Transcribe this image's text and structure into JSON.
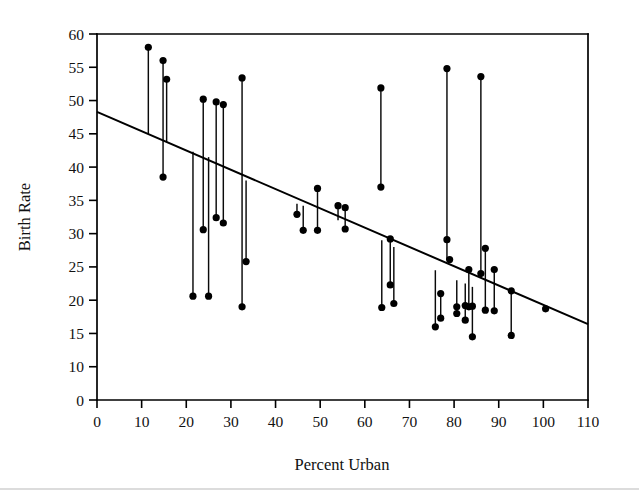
{
  "figure": {
    "title": "",
    "background_color": "#ffffff",
    "ink_color": "#000000",
    "width": 639,
    "height": 492
  },
  "axes": {
    "x_title": "Percent Urban",
    "y_title": "Birth Rate",
    "x_ticks": [
      "0",
      "10",
      "20",
      "30",
      "40",
      "50",
      "60",
      "70",
      "80",
      "90",
      "100",
      "110"
    ],
    "y_ticks": [
      "0",
      "10",
      "15",
      "20",
      "25",
      "30",
      "35",
      "40",
      "45",
      "50",
      "55",
      "60"
    ],
    "x_tick_values": [
      0,
      10,
      20,
      30,
      40,
      50,
      60,
      70,
      80,
      90,
      100,
      110
    ],
    "y_tick_values": [
      5,
      10,
      15,
      20,
      25,
      30,
      35,
      40,
      45,
      50,
      55,
      60
    ],
    "y_zero_label_note": "lowest tick is drawn at the 5 position but labelled 0"
  },
  "chart_data": {
    "type": "scatter",
    "title": "",
    "xlabel": "Percent Urban",
    "ylabel": "Birth Rate",
    "xlim": [
      0,
      110
    ],
    "ylim": [
      5,
      60
    ],
    "grid": false,
    "legend": null,
    "series": [
      {
        "name": "Observed birth rate",
        "marker": "filled-circle",
        "points": [
          {
            "x": 11.5,
            "y": 58.0
          },
          {
            "x": 14.8,
            "y": 56.0
          },
          {
            "x": 14.8,
            "y": 38.5
          },
          {
            "x": 15.6,
            "y": 53.2
          },
          {
            "x": 21.5,
            "y": 20.6
          },
          {
            "x": 23.8,
            "y": 50.2
          },
          {
            "x": 23.8,
            "y": 30.6
          },
          {
            "x": 25.0,
            "y": 20.6
          },
          {
            "x": 26.7,
            "y": 49.8
          },
          {
            "x": 26.7,
            "y": 32.4
          },
          {
            "x": 28.3,
            "y": 49.4
          },
          {
            "x": 28.3,
            "y": 31.6
          },
          {
            "x": 32.5,
            "y": 53.4
          },
          {
            "x": 32.5,
            "y": 19.0
          },
          {
            "x": 33.4,
            "y": 25.8
          },
          {
            "x": 44.8,
            "y": 32.9
          },
          {
            "x": 46.2,
            "y": 30.5
          },
          {
            "x": 49.4,
            "y": 36.8
          },
          {
            "x": 49.4,
            "y": 30.5
          },
          {
            "x": 54.0,
            "y": 34.2
          },
          {
            "x": 55.6,
            "y": 33.9
          },
          {
            "x": 55.6,
            "y": 30.7
          },
          {
            "x": 63.6,
            "y": 51.9
          },
          {
            "x": 63.6,
            "y": 37.0
          },
          {
            "x": 63.8,
            "y": 18.9
          },
          {
            "x": 65.7,
            "y": 29.2
          },
          {
            "x": 65.7,
            "y": 22.3
          },
          {
            "x": 66.5,
            "y": 19.5
          },
          {
            "x": 75.8,
            "y": 16.0
          },
          {
            "x": 77.0,
            "y": 21.0
          },
          {
            "x": 77.0,
            "y": 17.3
          },
          {
            "x": 78.4,
            "y": 54.8
          },
          {
            "x": 78.4,
            "y": 29.1
          },
          {
            "x": 79.0,
            "y": 26.1
          },
          {
            "x": 80.6,
            "y": 19.0
          },
          {
            "x": 80.6,
            "y": 18.0
          },
          {
            "x": 82.5,
            "y": 19.2
          },
          {
            "x": 82.5,
            "y": 17.0
          },
          {
            "x": 83.3,
            "y": 24.6
          },
          {
            "x": 83.3,
            "y": 19.0
          },
          {
            "x": 84.1,
            "y": 19.1
          },
          {
            "x": 84.1,
            "y": 14.5
          },
          {
            "x": 86.0,
            "y": 53.6
          },
          {
            "x": 86.0,
            "y": 24.0
          },
          {
            "x": 87.0,
            "y": 27.8
          },
          {
            "x": 87.0,
            "y": 18.5
          },
          {
            "x": 89.0,
            "y": 24.6
          },
          {
            "x": 89.0,
            "y": 18.4
          },
          {
            "x": 92.8,
            "y": 21.4
          },
          {
            "x": 92.8,
            "y": 14.7
          },
          {
            "x": 100.5,
            "y": 18.7
          }
        ]
      }
    ],
    "connectors": {
      "description": "vertical segments joining paired observations at the same Percent Urban",
      "segments": [
        {
          "x": 11.5,
          "y1": 58.0,
          "y2": 45.0
        },
        {
          "x": 14.8,
          "y1": 56.0,
          "y2": 38.5
        },
        {
          "x": 15.6,
          "y1": 53.2,
          "y2": 43.8
        },
        {
          "x": 21.5,
          "y1": 42.3,
          "y2": 20.6
        },
        {
          "x": 23.8,
          "y1": 50.2,
          "y2": 30.6
        },
        {
          "x": 25.0,
          "y1": 41.5,
          "y2": 20.6
        },
        {
          "x": 26.7,
          "y1": 49.8,
          "y2": 32.4
        },
        {
          "x": 28.3,
          "y1": 49.4,
          "y2": 31.6
        },
        {
          "x": 32.5,
          "y1": 53.4,
          "y2": 19.0
        },
        {
          "x": 33.4,
          "y1": 38.0,
          "y2": 25.8
        },
        {
          "x": 44.8,
          "y1": 34.5,
          "y2": 32.9
        },
        {
          "x": 46.2,
          "y1": 34.2,
          "y2": 30.5
        },
        {
          "x": 49.4,
          "y1": 36.8,
          "y2": 30.5
        },
        {
          "x": 54.0,
          "y1": 34.2,
          "y2": 32.0
        },
        {
          "x": 55.6,
          "y1": 33.9,
          "y2": 30.7
        },
        {
          "x": 63.6,
          "y1": 51.9,
          "y2": 37.0
        },
        {
          "x": 63.8,
          "y1": 29.0,
          "y2": 18.9
        },
        {
          "x": 65.7,
          "y1": 29.2,
          "y2": 22.3
        },
        {
          "x": 66.5,
          "y1": 28.0,
          "y2": 19.5
        },
        {
          "x": 75.8,
          "y1": 24.5,
          "y2": 16.0
        },
        {
          "x": 77.0,
          "y1": 21.0,
          "y2": 17.3
        },
        {
          "x": 78.4,
          "y1": 54.8,
          "y2": 26.1
        },
        {
          "x": 80.6,
          "y1": 23.0,
          "y2": 18.0
        },
        {
          "x": 82.5,
          "y1": 22.5,
          "y2": 17.0
        },
        {
          "x": 83.3,
          "y1": 24.6,
          "y2": 19.0
        },
        {
          "x": 84.1,
          "y1": 22.0,
          "y2": 14.5
        },
        {
          "x": 86.0,
          "y1": 53.6,
          "y2": 24.0
        },
        {
          "x": 87.0,
          "y1": 27.8,
          "y2": 18.5
        },
        {
          "x": 89.0,
          "y1": 24.6,
          "y2": 18.4
        },
        {
          "x": 92.8,
          "y1": 21.4,
          "y2": 14.7
        }
      ]
    },
    "regression_line": {
      "name": "fitted least-squares line",
      "x_start": 0,
      "y_start": 48.3,
      "x_end": 110,
      "y_end": 16.4,
      "slope": -0.29,
      "intercept": 48.3
    }
  }
}
